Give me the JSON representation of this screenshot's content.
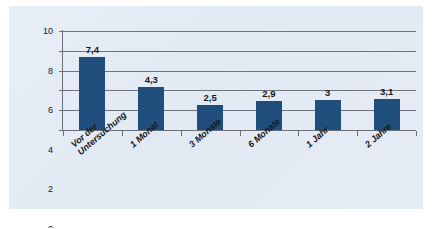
{
  "chart_data": {
    "type": "bar",
    "title": "",
    "subtitle": "",
    "xlabel": "",
    "ylabel": "",
    "categories": [
      "Vor der Untersuchung",
      "1 Monat",
      "3 Monate",
      "6 Monate",
      "1 Jahr",
      "2 Jahre"
    ],
    "category_lines": [
      [
        "Vor der",
        "Untersuchung"
      ],
      [
        "1 Monat"
      ],
      [
        "3 Monate"
      ],
      [
        "6 Monate"
      ],
      [
        "1 Jahr"
      ],
      [
        "2 Jahre"
      ]
    ],
    "values": [
      7.4,
      4.3,
      2.5,
      2.9,
      3.0,
      3.1
    ],
    "value_labels": [
      "7,4",
      "4,3",
      "2,5",
      "2,9",
      "3",
      "3,1"
    ],
    "ylim": [
      0,
      10
    ],
    "yticks": [
      0,
      2,
      4,
      6,
      8,
      10
    ],
    "ytick_labels": [
      "0",
      "2",
      "4",
      "6",
      "8",
      "10"
    ],
    "grid": true,
    "grid_axis": "y",
    "legend": false,
    "legend_position": "none",
    "series": [
      {
        "name": "",
        "values": [
          7.4,
          4.3,
          2.5,
          2.9,
          3.0,
          3.1
        ]
      }
    ]
  },
  "style": {
    "bar_color": "#1f4e7d",
    "panel_background": "#e3eaf4",
    "page_background": "#ffffff",
    "axis_color": "#6b7078",
    "grid_color": "#5a5f66",
    "text_color": "#15181c"
  }
}
